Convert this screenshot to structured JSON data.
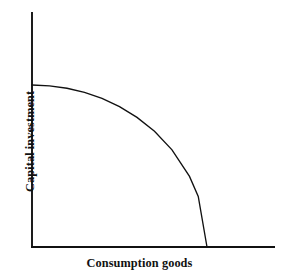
{
  "chart_data": {
    "type": "line",
    "title": "",
    "subtitle": "",
    "xlabel": "Consumption goods",
    "ylabel": "Capital investment",
    "xlim": [
      0,
      1
    ],
    "ylim": [
      0,
      1
    ],
    "grid": false,
    "legend": null,
    "legend_position": "none",
    "tick_labels": {
      "x": [],
      "y": []
    },
    "annotations": [],
    "series": [
      {
        "name": "Production possibility frontier",
        "shape": "concave quarter-ellipse arc",
        "x": [
          0.0,
          0.1,
          0.2,
          0.3,
          0.4,
          0.5,
          0.6,
          0.7,
          0.8,
          0.9,
          0.95,
          1.0
        ],
        "y": [
          1.0,
          0.995,
          0.98,
          0.954,
          0.917,
          0.866,
          0.8,
          0.714,
          0.6,
          0.436,
          0.312,
          0.0
        ],
        "y_intercept": 1.0,
        "x_intercept": 1.0
      }
    ]
  },
  "geometry": {
    "origin_x": 32,
    "origin_y": 247,
    "y_axis_top": 12,
    "x_axis_right": 275,
    "curve_y_intercept_px": 85,
    "curve_x_intercept_px": 207
  },
  "colors": {
    "background": "#ffffff",
    "axis": "#111111",
    "curve": "#111111",
    "label_text": "#111111"
  }
}
